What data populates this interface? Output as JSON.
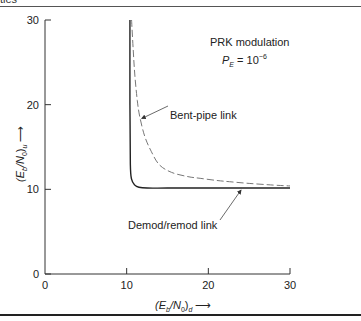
{
  "header": {
    "cut_text": "ties"
  },
  "chart_data": {
    "type": "line",
    "title": "PRK modulation",
    "subtitle": "P_E = 10^-6",
    "subtitle_parts": {
      "symbol": "P",
      "sub": "E",
      "eq": " = 10",
      "exp": "−6"
    },
    "xlabel": "(E_b/N_0)_d ⟶",
    "ylabel": "(E_b/N_0)_u ⟶",
    "xlabel_parts": {
      "pre": "(E",
      "sub1": "b",
      "mid": "/N",
      "sub2": "0",
      "close": ")",
      "sub3": "d",
      "arrow": " ⟶"
    },
    "ylabel_parts": {
      "pre": "(E",
      "sub1": "b",
      "mid": "/N",
      "sub2": "0",
      "close": ")",
      "sub3": "u",
      "arrow": " ⟶"
    },
    "xlim": [
      0,
      30
    ],
    "ylim": [
      0,
      30
    ],
    "xticks": [
      0,
      10,
      20,
      30
    ],
    "yticks": [
      0,
      10,
      20,
      30
    ],
    "xtick_labels": [
      "0",
      "10",
      "20",
      "30"
    ],
    "ytick_labels": [
      "0",
      "10",
      "20",
      "30"
    ],
    "grid": false,
    "series": [
      {
        "name": "Demod/remod link",
        "style": "solid",
        "x": [
          10.4,
          10.4,
          10.45,
          10.6,
          11.0,
          11.5,
          12.5,
          15,
          20,
          25,
          30
        ],
        "y": [
          30,
          20,
          13,
          11.2,
          10.5,
          10.25,
          10.15,
          10.15,
          10.15,
          10.15,
          10.15
        ]
      },
      {
        "name": "Bent-pipe link",
        "style": "dashed",
        "x": [
          10.6,
          10.8,
          11.0,
          11.3,
          11.6,
          12.2,
          13.0,
          14.0,
          15.5,
          17.5,
          19.0,
          21.0,
          22.6,
          25.0,
          28.0,
          30.0
        ],
        "y": [
          30,
          26.5,
          23.5,
          20.5,
          18.6,
          16.3,
          14.5,
          12.9,
          12.0,
          11.5,
          11.3,
          11.05,
          10.9,
          10.7,
          10.5,
          10.4
        ]
      }
    ],
    "annotations": [
      {
        "text": "Bent-pipe link",
        "points_to": {
          "x": 11.6,
          "y": 18.6
        }
      },
      {
        "text": "Demod/remod link",
        "points_to": {
          "x": 24,
          "y": 10.15
        }
      }
    ]
  }
}
